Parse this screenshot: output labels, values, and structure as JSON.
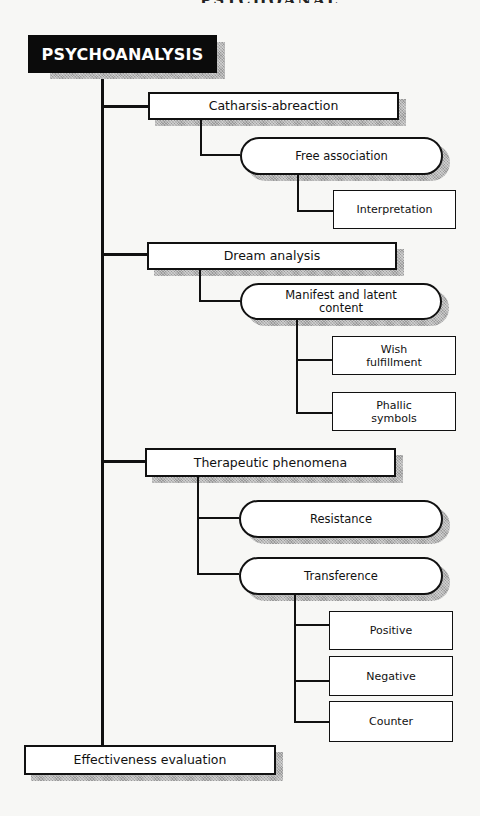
{
  "page": {
    "cut_off_header": "PSYCHOANALYSIS"
  },
  "diagram": {
    "root": {
      "label": "PSYCHOANALYSIS"
    },
    "branches": [
      {
        "label": "Catharsis-abreaction",
        "children": [
          {
            "label": "Free association",
            "shape": "pill",
            "children": [
              {
                "label": "Interpretation"
              }
            ]
          }
        ]
      },
      {
        "label": "Dream analysis",
        "children": [
          {
            "label": "Manifest and latent content",
            "shape": "pill",
            "children": [
              {
                "label": "Wish fulfillment"
              },
              {
                "label": "Phallic symbols"
              }
            ]
          }
        ]
      },
      {
        "label": "Therapeutic phenomena",
        "children": [
          {
            "label": "Resistance",
            "shape": "pill"
          },
          {
            "label": "Transference",
            "shape": "pill",
            "children": [
              {
                "label": "Positive"
              },
              {
                "label": "Negative"
              },
              {
                "label": "Counter"
              }
            ]
          }
        ]
      }
    ],
    "terminal": {
      "label": "Effectiveness evaluation"
    },
    "colors": {
      "root_bg": "#0b0b0b",
      "root_text": "#ffffff",
      "line": "#111111",
      "shadow": "#9a9a9a",
      "box_bg": "#ffffff",
      "page_bg": "#f7f7f5"
    }
  }
}
